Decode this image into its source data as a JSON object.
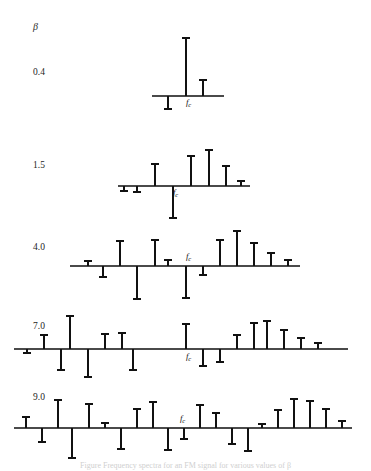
{
  "figure": {
    "beta_symbol": "β",
    "carrier_label_f": "f",
    "carrier_label_sub": "c",
    "caption": "Figure  Frequency spectra for an FM signal for various values of β",
    "axis_color": "#4a4a4a",
    "stem_color": "#111111",
    "background_color": "#ffffff",
    "width": 371,
    "height": 468
  },
  "chart_data": {
    "type": "bar",
    "xlabel": "frequency",
    "ylabel": "relative amplitude (Bessel coefficient Jn)",
    "grid": false,
    "legend": "none",
    "x_tick_labels": [
      "fc"
    ],
    "rows": [
      {
        "beta_label": "0.4",
        "beta_value": 0.4,
        "label_x": 33,
        "label_y": 73,
        "baseline_y": 96,
        "axis_x1": 152,
        "axis_x2": 224,
        "carrier_x": 186,
        "carrier_label_x": 189,
        "carrier_label_y": 105,
        "spacing": 16,
        "n": [
          -1,
          0,
          1
        ],
        "values": [
          -0.196,
          0.96,
          0.196
        ],
        "pixel_heights": [
          -12,
          56,
          15
        ]
      },
      {
        "beta_label": "1.5",
        "beta_value": 1.5,
        "label_x": 33,
        "label_y": 166,
        "baseline_y": 186,
        "axis_x1": 118,
        "axis_x2": 250,
        "carrier_x": 173,
        "carrier_label_x": 176,
        "carrier_label_y": 195,
        "spacing": 18,
        "n": [
          -3,
          -2,
          -1,
          0,
          1,
          2,
          3
        ],
        "values": [
          -0.061,
          0.232,
          -0.558,
          0.512,
          0.558,
          0.232,
          0.061
        ],
        "pixel_heights": [
          -6,
          22,
          -28,
          28,
          34,
          18,
          5
        ]
      },
      {
        "beta_label": "4.0",
        "beta_value": 4.0,
        "label_x": 33,
        "label_y": 248,
        "baseline_y": 266,
        "axis_x1": 70,
        "axis_x2": 300,
        "carrier_x": 186,
        "carrier_label_x": 189,
        "carrier_label_y": 258,
        "spacing": 17,
        "n": [
          -6,
          -5,
          -4,
          -3,
          -2,
          -1,
          0,
          1,
          2,
          3,
          4,
          5,
          6
        ],
        "values": [
          0.049,
          -0.132,
          0.281,
          -0.43,
          0.364,
          0.066,
          -0.398,
          -0.066,
          0.364,
          0.43,
          0.281,
          0.132,
          0.049
        ],
        "pixel_heights": [
          5,
          -11,
          22,
          -32,
          26,
          6,
          -30,
          -7,
          26,
          32,
          22,
          12,
          5
        ]
      },
      {
        "beta_label": "7.0",
        "beta_value": 7.0,
        "label_x": 33,
        "label_y": 327,
        "baseline_y": 349,
        "axis_x1": 14,
        "axis_x2": 348,
        "carrier_x": 186,
        "carrier_label_x": 189,
        "carrier_label_y": 360,
        "spacing": 17,
        "n": [
          -10,
          -9,
          -8,
          -7,
          -6,
          -5,
          -4,
          -3,
          -2,
          -1,
          0,
          1,
          2,
          3,
          4,
          5,
          6,
          7,
          8,
          9,
          10
        ],
        "values": [
          0.045,
          0.151,
          -0.238,
          0.234,
          -0.015,
          -0.301,
          0.158,
          0.168,
          -0.047,
          -0.301,
          0.3,
          0.301,
          -0.047,
          -0.168,
          0.158,
          0.301,
          -0.015,
          -0.234,
          -0.238,
          -0.151,
          0.045
        ],
        "pixel_heights": [
          -4,
          12,
          -21,
          32,
          -28,
          14,
          15,
          -19,
          0,
          0,
          24,
          -16,
          -12,
          13,
          25,
          27,
          18,
          10,
          5,
          0,
          0
        ]
      },
      {
        "beta_label": "9.0",
        "beta_value": 9.0,
        "label_x": 33,
        "label_y": 398,
        "baseline_y": 428,
        "axis_x1": 14,
        "axis_x2": 352,
        "carrier_x": 186,
        "carrier_label_x": 182,
        "carrier_label_y": 422,
        "spacing": 17,
        "n": [
          -12,
          -11,
          -10,
          -9,
          -8,
          -7,
          -6,
          -5,
          -4,
          -3,
          -2,
          -1,
          0,
          1,
          2,
          3,
          4,
          5,
          6,
          7,
          8,
          9,
          10,
          11,
          12
        ],
        "values": [
          0.035,
          -0.123,
          0.246,
          -0.265,
          0.062,
          0.204,
          -0.18,
          -0.055,
          0.295,
          -0.181,
          -0.09,
          0.245,
          -0.09,
          0.245,
          -0.09,
          -0.181,
          0.295,
          -0.055,
          -0.18,
          0.204,
          0.062,
          -0.265,
          0.246,
          -0.123,
          0.035
        ]
      }
    ],
    "row0_stems": [
      {
        "x": 168,
        "h": -13
      },
      {
        "x": 186,
        "h": 58
      },
      {
        "x": 203,
        "h": 16
      }
    ],
    "row1_stems": [
      {
        "x": 124,
        "h": -5
      },
      {
        "x": 137,
        "h": -6
      },
      {
        "x": 155,
        "h": 22
      },
      {
        "x": 173,
        "h": -32
      },
      {
        "x": 191,
        "h": 30
      },
      {
        "x": 209,
        "h": 36
      },
      {
        "x": 226,
        "h": 20
      },
      {
        "x": 241,
        "h": 5
      }
    ],
    "row2_stems": [
      {
        "x": 88,
        "h": 5
      },
      {
        "x": 103,
        "h": -11
      },
      {
        "x": 120,
        "h": 25
      },
      {
        "x": 137,
        "h": -33
      },
      {
        "x": 155,
        "h": 26
      },
      {
        "x": 168,
        "h": 6
      },
      {
        "x": 186,
        "h": -32
      },
      {
        "x": 203,
        "h": -9
      },
      {
        "x": 220,
        "h": 26
      },
      {
        "x": 237,
        "h": 35
      },
      {
        "x": 254,
        "h": 23
      },
      {
        "x": 271,
        "h": 13
      },
      {
        "x": 288,
        "h": 6
      }
    ],
    "row3_stems": [
      {
        "x": 27,
        "h": -4
      },
      {
        "x": 44,
        "h": 14
      },
      {
        "x": 61,
        "h": -21
      },
      {
        "x": 70,
        "h": 33
      },
      {
        "x": 88,
        "h": -28
      },
      {
        "x": 105,
        "h": 15
      },
      {
        "x": 122,
        "h": 16
      },
      {
        "x": 133,
        "h": -21
      },
      {
        "x": 150,
        "h": 0
      },
      {
        "x": 167,
        "h": 0
      },
      {
        "x": 186,
        "h": 25
      },
      {
        "x": 203,
        "h": -17
      },
      {
        "x": 220,
        "h": -13
      },
      {
        "x": 237,
        "h": 14
      },
      {
        "x": 254,
        "h": 26
      },
      {
        "x": 267,
        "h": 28
      },
      {
        "x": 284,
        "h": 19
      },
      {
        "x": 301,
        "h": 11
      },
      {
        "x": 318,
        "h": 6
      }
    ],
    "row4_stems": [
      {
        "x": 26,
        "h": 11
      },
      {
        "x": 42,
        "h": -14
      },
      {
        "x": 58,
        "h": 28
      },
      {
        "x": 72,
        "h": -30
      },
      {
        "x": 89,
        "h": 24
      },
      {
        "x": 105,
        "h": 5
      },
      {
        "x": 121,
        "h": -21
      },
      {
        "x": 137,
        "h": 19
      },
      {
        "x": 153,
        "h": 26
      },
      {
        "x": 168,
        "h": -22
      },
      {
        "x": 184,
        "h": -11
      },
      {
        "x": 200,
        "h": 23
      },
      {
        "x": 216,
        "h": 15
      },
      {
        "x": 232,
        "h": -16
      },
      {
        "x": 248,
        "h": -23
      },
      {
        "x": 262,
        "h": 4
      },
      {
        "x": 278,
        "h": 18
      },
      {
        "x": 294,
        "h": 29
      },
      {
        "x": 310,
        "h": 27
      },
      {
        "x": 326,
        "h": 19
      },
      {
        "x": 342,
        "h": 7
      }
    ]
  }
}
